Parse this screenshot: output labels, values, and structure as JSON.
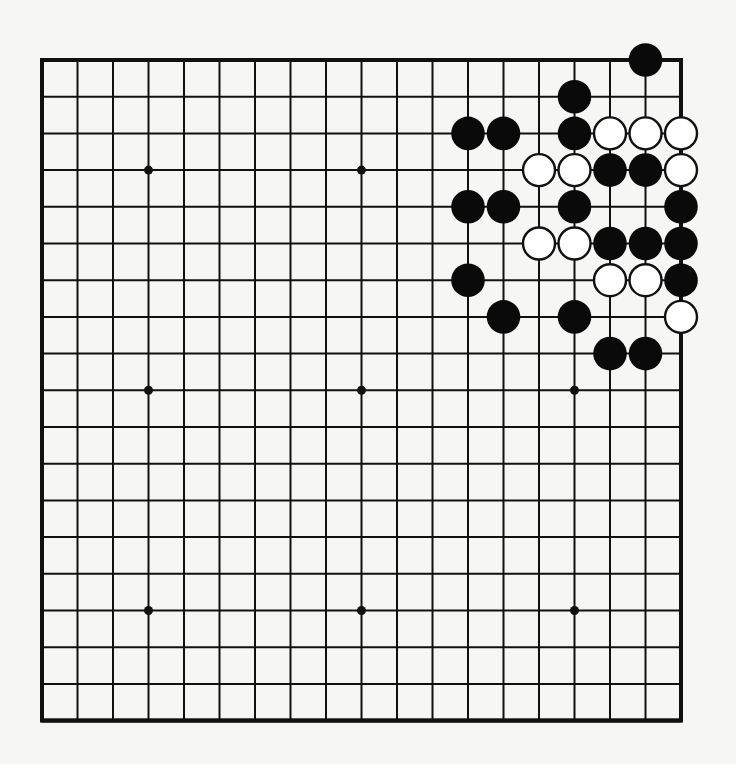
{
  "board": {
    "size": 19,
    "star_points": [
      [
        3,
        3
      ],
      [
        3,
        9
      ],
      [
        3,
        15
      ],
      [
        9,
        3
      ],
      [
        9,
        9
      ],
      [
        9,
        15
      ],
      [
        15,
        3
      ],
      [
        15,
        9
      ],
      [
        15,
        15
      ]
    ],
    "colors": {
      "background": "#f6f6f4",
      "line": "#111111",
      "black_stone": "#0a0a0a",
      "white_stone": "#ffffff",
      "white_stone_outline": "#111111"
    },
    "stones": [
      {
        "row": 0,
        "col": 17,
        "color": "black"
      },
      {
        "row": 1,
        "col": 15,
        "color": "black"
      },
      {
        "row": 2,
        "col": 12,
        "color": "black"
      },
      {
        "row": 2,
        "col": 13,
        "color": "black"
      },
      {
        "row": 2,
        "col": 15,
        "color": "black"
      },
      {
        "row": 2,
        "col": 16,
        "color": "white"
      },
      {
        "row": 2,
        "col": 17,
        "color": "white"
      },
      {
        "row": 2,
        "col": 18,
        "color": "white"
      },
      {
        "row": 3,
        "col": 14,
        "color": "white"
      },
      {
        "row": 3,
        "col": 15,
        "color": "white"
      },
      {
        "row": 3,
        "col": 16,
        "color": "black"
      },
      {
        "row": 3,
        "col": 17,
        "color": "black"
      },
      {
        "row": 3,
        "col": 18,
        "color": "white"
      },
      {
        "row": 4,
        "col": 12,
        "color": "black"
      },
      {
        "row": 4,
        "col": 13,
        "color": "black"
      },
      {
        "row": 4,
        "col": 15,
        "color": "black"
      },
      {
        "row": 4,
        "col": 18,
        "color": "black"
      },
      {
        "row": 5,
        "col": 14,
        "color": "white"
      },
      {
        "row": 5,
        "col": 15,
        "color": "white"
      },
      {
        "row": 5,
        "col": 16,
        "color": "black"
      },
      {
        "row": 5,
        "col": 17,
        "color": "black"
      },
      {
        "row": 5,
        "col": 18,
        "color": "black"
      },
      {
        "row": 6,
        "col": 12,
        "color": "black"
      },
      {
        "row": 6,
        "col": 16,
        "color": "white"
      },
      {
        "row": 6,
        "col": 17,
        "color": "white"
      },
      {
        "row": 6,
        "col": 18,
        "color": "black"
      },
      {
        "row": 7,
        "col": 13,
        "color": "black"
      },
      {
        "row": 7,
        "col": 15,
        "color": "black"
      },
      {
        "row": 7,
        "col": 18,
        "color": "white"
      },
      {
        "row": 8,
        "col": 16,
        "color": "black"
      },
      {
        "row": 8,
        "col": 17,
        "color": "black"
      }
    ]
  }
}
